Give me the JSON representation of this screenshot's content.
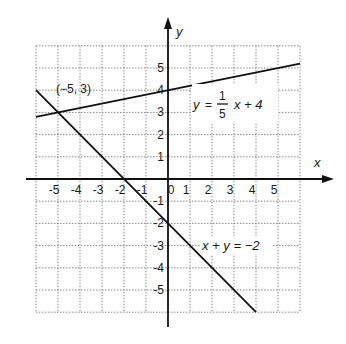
{
  "chart_data": {
    "type": "line",
    "title": "",
    "xlabel": "x",
    "ylabel": "y",
    "xlim": [
      -6,
      6
    ],
    "ylim": [
      -6,
      6
    ],
    "grid": true,
    "x_ticks": [
      -5,
      -4,
      -3,
      -2,
      -1,
      0,
      1,
      2,
      3,
      4,
      5
    ],
    "y_ticks": [
      5,
      4,
      3,
      2,
      1,
      -1,
      -2,
      -3,
      -4,
      -5
    ],
    "series": [
      {
        "name": "y = 1/5 x + 4",
        "x": [
          -6,
          6
        ],
        "y": [
          2.8,
          5.2
        ]
      },
      {
        "name": "x + y = -2",
        "x": [
          -6,
          4
        ],
        "y": [
          4,
          -6
        ]
      }
    ],
    "annotations": [
      {
        "text": "(−5, 3)",
        "x": -5,
        "y": 3
      },
      {
        "text": "y = 1/5 x + 4"
      },
      {
        "text": "x + y = −2"
      }
    ]
  },
  "labels": {
    "x_axis": "x",
    "y_axis": "y",
    "point": "(−5, 3)",
    "line1_y": "y",
    "line1_eq": "=",
    "line1_num": "1",
    "line1_den": "5",
    "line1_rest": "x + 4",
    "line2": "x + y = −2"
  }
}
